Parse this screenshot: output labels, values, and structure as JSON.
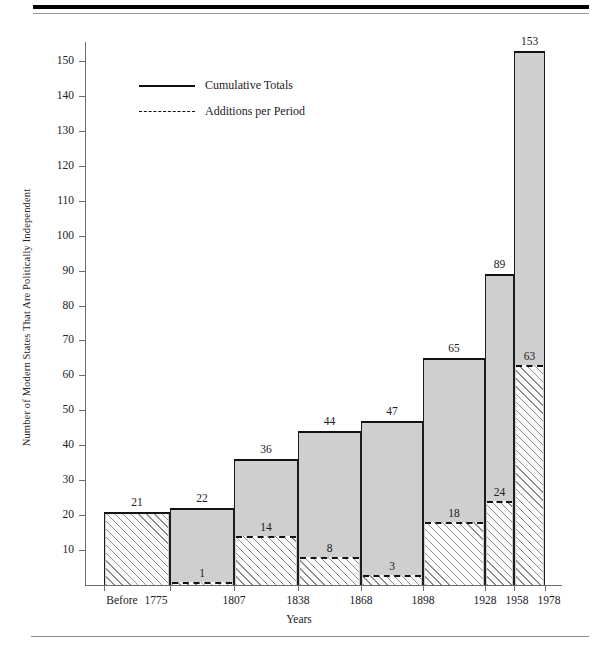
{
  "chart_data": {
    "type": "bar",
    "title": "",
    "xlabel": "Years",
    "ylabel": "Number of Modern States That Are Politically Independent",
    "categories": [
      "Before 1775",
      "1807",
      "1838",
      "1868",
      "1898",
      "1928",
      "1958",
      "1978"
    ],
    "x_tick_labels": [
      "Before",
      "1775",
      "1807",
      "1838",
      "1868",
      "1898",
      "1928",
      "1958",
      "1978"
    ],
    "y_tick_labels": [
      "10",
      "20",
      "30",
      "40",
      "50",
      "60",
      "70",
      "80",
      "90",
      "100",
      "110",
      "120",
      "130",
      "140",
      "150"
    ],
    "y_tick_values": [
      10,
      20,
      30,
      40,
      50,
      60,
      70,
      80,
      90,
      100,
      110,
      120,
      130,
      140,
      150
    ],
    "ylim": [
      0,
      156
    ],
    "grid": false,
    "legend_position": "upper-left-inside",
    "series": [
      {
        "name": "Cumulative Totals",
        "style": "solid",
        "values": [
          21,
          22,
          36,
          44,
          47,
          65,
          89,
          153
        ]
      },
      {
        "name": "Additions per Period",
        "style": "dashed",
        "values": [
          null,
          1,
          14,
          8,
          3,
          18,
          24,
          63
        ]
      }
    ],
    "bars": [
      {
        "period": "Before 1775",
        "total": 21,
        "total_label": "21",
        "addition": null,
        "addition_label": ""
      },
      {
        "period": "1775-1807",
        "total": 22,
        "total_label": "22",
        "addition": 1,
        "addition_label": "1"
      },
      {
        "period": "1807-1838",
        "total": 36,
        "total_label": "36",
        "addition": 14,
        "addition_label": "14"
      },
      {
        "period": "1838-1868",
        "total": 44,
        "total_label": "44",
        "addition": 8,
        "addition_label": "8"
      },
      {
        "period": "1868-1898",
        "total": 47,
        "total_label": "47",
        "addition": 3,
        "addition_label": "3"
      },
      {
        "period": "1898-1928",
        "total": 65,
        "total_label": "65",
        "addition": 18,
        "addition_label": "18"
      },
      {
        "period": "1928-1958",
        "total": 89,
        "total_label": "89",
        "addition": 24,
        "addition_label": "24"
      },
      {
        "period": "1958-1978",
        "total": 153,
        "total_label": "153",
        "addition": 63,
        "addition_label": "63"
      }
    ],
    "colors": {
      "bar_fill": "#cfcfcf",
      "bar_outline": "#121212",
      "hatch_line": "#8f8f8f",
      "hatch_background": "#fbfbfb",
      "axis": "#6d6d6d",
      "text": "#23201d",
      "rule": "#000000"
    }
  },
  "legend": {
    "items": [
      {
        "label": "Cumulative Totals",
        "style": "solid"
      },
      {
        "label": "Additions per Period",
        "style": "dashed"
      }
    ]
  },
  "axes": {
    "x_title": "Years",
    "y_title": "Number of Modern States That Are Politically Independent"
  }
}
